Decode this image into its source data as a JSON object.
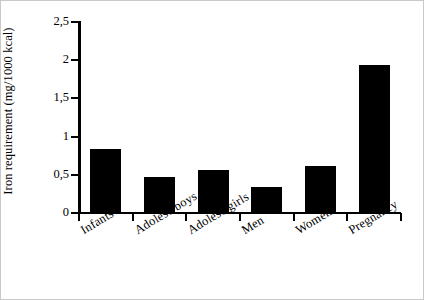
{
  "chart_data": {
    "type": "bar",
    "title": "",
    "xlabel": "",
    "ylabel": "Iron requirement (mg/1000 kcal)",
    "categories": [
      "Infants",
      "Adolesc boys",
      "Adolesc girls",
      "Men",
      "Women",
      "Pregnancy"
    ],
    "values": [
      0.84,
      0.47,
      0.56,
      0.34,
      0.61,
      1.94
    ],
    "ylim": [
      0,
      2.5
    ],
    "ytick_values": [
      0,
      0.5,
      1,
      1.5,
      2,
      2.5
    ],
    "ytick_labels": [
      "0",
      "0,5",
      "1",
      "1,5",
      "2",
      "2,5"
    ],
    "grid": false,
    "legend": false,
    "bar_color": "#000000",
    "axis_color": "#000000",
    "background_color": "#ffffff"
  }
}
